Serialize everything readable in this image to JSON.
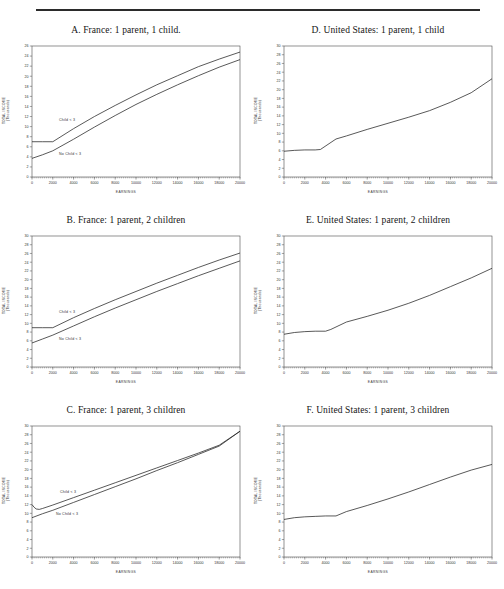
{
  "figure": {
    "rule": true,
    "axis_labels": {
      "y": [
        "TOTAL INCOME",
        "(Thousands)"
      ],
      "x": "EARNINGS"
    },
    "annotations": {
      "with_child": "Child < 3",
      "no_child": "No Child < 3"
    }
  },
  "chart_data": [
    {
      "id": "A",
      "type": "line",
      "title": "A.  France: 1 parent, 1 child.",
      "xlabel": "EARNINGS",
      "ylabel": "TOTAL INCOME (Thousands)",
      "xlim": [
        0,
        20000
      ],
      "ylim": [
        0,
        26
      ],
      "xticks": [
        0,
        2000,
        4000,
        6000,
        8000,
        10000,
        12000,
        14000,
        16000,
        18000,
        20000
      ],
      "yticks": [
        0,
        2,
        4,
        6,
        8,
        10,
        12,
        14,
        16,
        18,
        20,
        22,
        24,
        26
      ],
      "grid": false,
      "legend": "inline-annotation",
      "series": [
        {
          "name": "Child < 3",
          "x": [
            0,
            1000,
            2000,
            4000,
            6000,
            8000,
            10000,
            12000,
            14000,
            16000,
            18000,
            20000
          ],
          "values": [
            7.0,
            7.0,
            7.0,
            9.6,
            12.0,
            14.2,
            16.3,
            18.3,
            20.1,
            21.9,
            23.4,
            24.8
          ]
        },
        {
          "name": "No Child < 3",
          "x": [
            0,
            1000,
            2000,
            4000,
            6000,
            8000,
            10000,
            12000,
            14000,
            16000,
            18000,
            20000
          ],
          "values": [
            3.7,
            4.4,
            5.2,
            7.5,
            9.9,
            12.2,
            14.4,
            16.4,
            18.3,
            20.1,
            21.8,
            23.3
          ]
        }
      ]
    },
    {
      "id": "D",
      "type": "line",
      "title": "D.  United States: 1 parent, 1 child",
      "xlabel": "EARNINGS",
      "ylabel": "TOTAL INCOME (Thousands)",
      "xlim": [
        0,
        20000
      ],
      "ylim": [
        0,
        30
      ],
      "xticks": [
        0,
        2000,
        4000,
        6000,
        8000,
        10000,
        12000,
        14000,
        16000,
        18000,
        20000
      ],
      "yticks": [
        0,
        2,
        4,
        6,
        8,
        10,
        12,
        14,
        16,
        18,
        20,
        22,
        24,
        26,
        28,
        30
      ],
      "grid": false,
      "legend": "none",
      "series": [
        {
          "name": "Total income",
          "x": [
            0,
            1000,
            2000,
            3000,
            3500,
            5000,
            6000,
            8000,
            10000,
            12000,
            14000,
            16000,
            18000,
            20000
          ],
          "values": [
            5.9,
            6.1,
            6.2,
            6.2,
            6.3,
            8.7,
            9.4,
            10.9,
            12.3,
            13.7,
            15.2,
            17.1,
            19.3,
            22.5
          ]
        }
      ]
    },
    {
      "id": "B",
      "type": "line",
      "title": "B.  France: 1 parent, 2 children",
      "xlabel": "EARNINGS",
      "ylabel": "TOTAL INCOME (Thousands)",
      "xlim": [
        0,
        20000
      ],
      "ylim": [
        0,
        30
      ],
      "xticks": [
        0,
        2000,
        4000,
        6000,
        8000,
        10000,
        12000,
        14000,
        16000,
        18000,
        20000
      ],
      "yticks": [
        0,
        2,
        4,
        6,
        8,
        10,
        12,
        14,
        16,
        18,
        20,
        22,
        24,
        26,
        28,
        30
      ],
      "grid": false,
      "legend": "inline-annotation",
      "series": [
        {
          "name": "Child < 3",
          "x": [
            0,
            1000,
            2000,
            4000,
            6000,
            8000,
            10000,
            12000,
            14000,
            16000,
            18000,
            20000
          ],
          "values": [
            9.0,
            9.0,
            9.0,
            11.3,
            13.4,
            15.4,
            17.3,
            19.2,
            21.0,
            22.8,
            24.5,
            26.1
          ]
        },
        {
          "name": "No Child < 3",
          "x": [
            0,
            1000,
            2000,
            4000,
            6000,
            8000,
            10000,
            12000,
            14000,
            16000,
            18000,
            20000
          ],
          "values": [
            5.5,
            6.4,
            7.3,
            9.4,
            11.5,
            13.5,
            15.4,
            17.3,
            19.1,
            20.9,
            22.6,
            24.3
          ]
        }
      ]
    },
    {
      "id": "E",
      "type": "line",
      "title": "E.  United States: 1 parent, 2 children",
      "xlabel": "EARNINGS",
      "ylabel": "TOTAL INCOME (Thousands)",
      "xlim": [
        0,
        20000
      ],
      "ylim": [
        0,
        30
      ],
      "xticks": [
        0,
        2000,
        4000,
        6000,
        8000,
        10000,
        12000,
        14000,
        16000,
        18000,
        20000
      ],
      "yticks": [
        0,
        2,
        4,
        6,
        8,
        10,
        12,
        14,
        16,
        18,
        20,
        22,
        24,
        26,
        28,
        30
      ],
      "grid": false,
      "legend": "none",
      "series": [
        {
          "name": "Total income",
          "x": [
            0,
            1000,
            2000,
            3000,
            4000,
            4500,
            6000,
            8000,
            10000,
            12000,
            14000,
            16000,
            18000,
            20000
          ],
          "values": [
            7.5,
            7.9,
            8.1,
            8.2,
            8.2,
            8.6,
            10.3,
            11.6,
            13.0,
            14.6,
            16.4,
            18.4,
            20.4,
            22.6
          ]
        }
      ]
    },
    {
      "id": "C",
      "type": "line",
      "title": "C.  France: 1 parent, 3 children",
      "xlabel": "EARNINGS",
      "ylabel": "TOTAL INCOME (Thousands)",
      "xlim": [
        0,
        20000
      ],
      "ylim": [
        0,
        30
      ],
      "xticks": [
        0,
        2000,
        4000,
        6000,
        8000,
        10000,
        12000,
        14000,
        16000,
        18000,
        20000
      ],
      "yticks": [
        0,
        2,
        4,
        6,
        8,
        10,
        12,
        14,
        16,
        18,
        20,
        22,
        24,
        26,
        28,
        30
      ],
      "grid": false,
      "legend": "inline-annotation",
      "series": [
        {
          "name": "Child < 3",
          "x": [
            0,
            200,
            400,
            700,
            1000,
            2000,
            4000,
            6000,
            8000,
            10000,
            12000,
            14000,
            16000,
            18000,
            20000
          ],
          "values": [
            12.0,
            11.4,
            11.0,
            10.9,
            11.1,
            11.9,
            13.6,
            15.3,
            17.0,
            18.7,
            20.4,
            22.1,
            23.8,
            25.6,
            28.8
          ]
        },
        {
          "name": "No Child < 3",
          "x": [
            0,
            1000,
            2000,
            4000,
            6000,
            8000,
            10000,
            12000,
            14000,
            16000,
            18000,
            20000
          ],
          "values": [
            9.0,
            9.9,
            10.7,
            12.5,
            14.3,
            16.1,
            17.9,
            19.8,
            21.6,
            23.5,
            25.4,
            28.8
          ]
        }
      ]
    },
    {
      "id": "F",
      "type": "line",
      "title": "F.  United States: 1 parent, 3 children",
      "xlabel": "EARNINGS",
      "ylabel": "TOTAL INCOME (Thousands)",
      "xlim": [
        0,
        20000
      ],
      "ylim": [
        0,
        30
      ],
      "xticks": [
        0,
        2000,
        4000,
        6000,
        8000,
        10000,
        12000,
        14000,
        16000,
        18000,
        20000
      ],
      "yticks": [
        0,
        2,
        4,
        6,
        8,
        10,
        12,
        14,
        16,
        18,
        20,
        22,
        24,
        26,
        28,
        30
      ],
      "grid": false,
      "legend": "none",
      "series": [
        {
          "name": "Total income",
          "x": [
            0,
            1000,
            2000,
            3000,
            4000,
            5000,
            6000,
            8000,
            10000,
            12000,
            14000,
            16000,
            18000,
            20000
          ],
          "values": [
            8.6,
            9.0,
            9.2,
            9.3,
            9.4,
            9.4,
            10.4,
            11.8,
            13.3,
            14.9,
            16.6,
            18.3,
            19.9,
            21.2
          ]
        }
      ]
    }
  ]
}
